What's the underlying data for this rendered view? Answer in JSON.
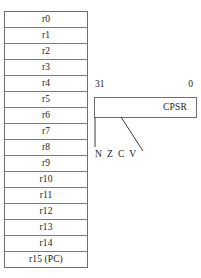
{
  "diagram": {
    "ink_color": "#1a1a1a",
    "line_color": "#6e6e6e",
    "background": "#ffffff"
  },
  "register_file": {
    "name": "register-file",
    "registers": [
      {
        "label": "r0"
      },
      {
        "label": "r1"
      },
      {
        "label": "r2"
      },
      {
        "label": "r3"
      },
      {
        "label": "r4"
      },
      {
        "label": "r5"
      },
      {
        "label": "r6"
      },
      {
        "label": "r7"
      },
      {
        "label": "r8"
      },
      {
        "label": "r9"
      },
      {
        "label": "r10"
      },
      {
        "label": "r11"
      },
      {
        "label": "r12"
      },
      {
        "label": "r13"
      },
      {
        "label": "r14"
      },
      {
        "label": "r15 (PC)"
      }
    ]
  },
  "cpsr": {
    "label": "CPSR",
    "bit_msb": "31",
    "bit_lsb": "0",
    "flags_label": "N Z C V"
  }
}
